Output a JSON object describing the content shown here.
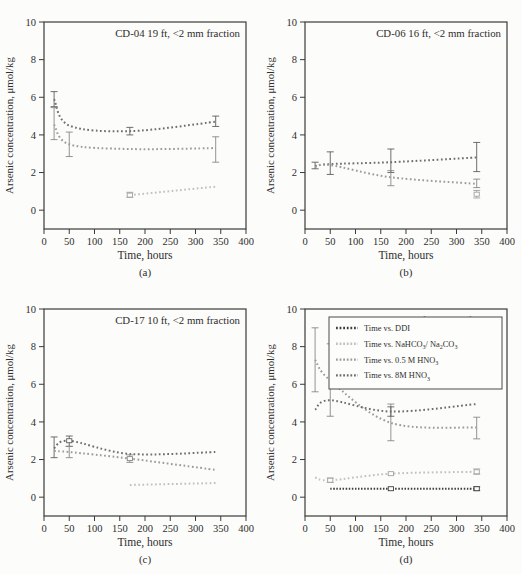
{
  "page": {
    "background": "#fcfcfa",
    "frame_color": "#3a3a3a",
    "text_color": "#2e2e2e"
  },
  "axes": {
    "x": {
      "label": "Time, hours",
      "min": 0,
      "max": 400,
      "ticks": [
        0,
        50,
        100,
        150,
        200,
        250,
        300,
        350,
        400
      ]
    },
    "y": {
      "label": "Arsenic concentration, μmol/kg",
      "min": -1,
      "max": 10,
      "ticks": [
        0,
        2,
        4,
        6,
        8,
        10
      ]
    }
  },
  "series_styles": {
    "ddi": {
      "color": "#3f3f3f",
      "err_color": "#3f3f3f",
      "dash": "1.5 1.6",
      "label_segments": [
        {
          "t": "Time vs. DDI"
        }
      ]
    },
    "nahco3": {
      "color": "#c1c1c1",
      "err_color": "#a2a2a2",
      "dash": "1.7 2.5",
      "label_segments": [
        {
          "t": "Time vs. NaHCO"
        },
        {
          "t": "3",
          "sub": true
        },
        {
          "t": "/ Na",
          "sub": false
        },
        {
          "t": "2",
          "sub": true
        },
        {
          "t": "CO",
          "sub": false
        },
        {
          "t": "3",
          "sub": true
        }
      ]
    },
    "hno3_05": {
      "color": "#9b9b9b",
      "err_color": "#888888",
      "dash": "1.7 2.5",
      "label_segments": [
        {
          "t": "Time vs. 0.5 M HNO"
        },
        {
          "t": "3",
          "sub": true
        }
      ]
    },
    "hno3_8": {
      "color": "#6d6d6d",
      "err_color": "#5e5e5e",
      "dash": "1.7 2.5",
      "label_segments": [
        {
          "t": "Time vs. 8M HNO"
        },
        {
          "t": "3",
          "sub": true
        }
      ]
    }
  },
  "legend": {
    "order": [
      "ddi",
      "nahco3",
      "hno3_05",
      "hno3_8"
    ],
    "position": "upper-right-panel-d"
  },
  "chart_data": [
    {
      "type": "line",
      "panel": "a",
      "title": "CD-04 19 ft, <2 mm fraction",
      "caption": "(a)",
      "xlabel": "Time, hours",
      "ylabel": "Arsenic concentration, μmol/kg",
      "xlim": [
        0,
        400
      ],
      "ylim": [
        -1,
        10
      ],
      "xticks": [
        0,
        50,
        100,
        150,
        200,
        250,
        300,
        350,
        400
      ],
      "yticks": [
        0,
        2,
        4,
        6,
        8,
        10
      ],
      "show_legend": false,
      "series": [
        {
          "key": "hno3_8",
          "name": "Time vs. 8M HNO3",
          "points": [
            {
              "t": 20,
              "v": 5.9,
              "err": [
                5.5,
                6.3
              ]
            },
            {
              "t": 50,
              "v": 4.5
            },
            {
              "t": 170,
              "v": 4.2,
              "err": [
                4.0,
                4.4
              ]
            },
            {
              "t": 340,
              "v": 4.7,
              "err": [
                4.45,
                5.0
              ]
            }
          ]
        },
        {
          "key": "hno3_05",
          "name": "Time vs. 0.5 M HNO3",
          "points": [
            {
              "t": 20,
              "v": 4.55,
              "err": [
                3.75,
                5.45
              ]
            },
            {
              "t": 50,
              "v": 3.5,
              "err": [
                2.85,
                4.15
              ]
            },
            {
              "t": 170,
              "v": 3.25
            },
            {
              "t": 340,
              "v": 3.3,
              "err": [
                2.55,
                3.9
              ]
            }
          ]
        },
        {
          "key": "nahco3",
          "name": "Time vs. NaHCO3/Na2CO3",
          "points": [
            {
              "t": 170,
              "v": 0.8,
              "err": [
                0.68,
                0.95
              ],
              "sq": true
            },
            {
              "t": 340,
              "v": 1.25
            }
          ]
        }
      ]
    },
    {
      "type": "line",
      "panel": "b",
      "title": "CD-06 16 ft, <2 mm fraction",
      "caption": "(b)",
      "xlabel": "Time, hours",
      "ylabel": "Arsenic concentration, μmol/kg",
      "xlim": [
        0,
        400
      ],
      "ylim": [
        -1,
        10
      ],
      "xticks": [
        0,
        50,
        100,
        150,
        200,
        250,
        300,
        350,
        400
      ],
      "yticks": [
        0,
        2,
        4,
        6,
        8,
        10
      ],
      "show_legend": false,
      "series": [
        {
          "key": "hno3_8",
          "name": "Time vs. 8M HNO3",
          "points": [
            {
              "t": 20,
              "v": 2.35,
              "err": [
                2.2,
                2.55
              ]
            },
            {
              "t": 50,
              "v": 2.45,
              "err": [
                1.9,
                3.1
              ]
            },
            {
              "t": 170,
              "v": 2.55,
              "err": [
                2.0,
                3.25
              ]
            },
            {
              "t": 340,
              "v": 2.8,
              "err": [
                2.05,
                3.6
              ]
            }
          ]
        },
        {
          "key": "hno3_05",
          "name": "Time vs. 0.5 M HNO3",
          "points": [
            {
              "t": 20,
              "v": 2.3
            },
            {
              "t": 50,
              "v": 2.4
            },
            {
              "t": 170,
              "v": 1.75,
              "err": [
                1.3,
                2.1
              ]
            },
            {
              "t": 340,
              "v": 1.4,
              "err": [
                1.2,
                1.65
              ]
            }
          ]
        },
        {
          "key": "nahco3",
          "name": "Time vs. NaHCO3/Na2CO3",
          "points": [
            {
              "t": 340,
              "v": 0.85,
              "err": [
                0.65,
                1.05
              ],
              "sq": true
            }
          ]
        }
      ]
    },
    {
      "type": "line",
      "panel": "c",
      "title": "CD-17 10 ft, <2 mm fraction",
      "caption": "(c)",
      "xlabel": "Time, hours",
      "ylabel": "Arsenic concentration, μmol/kg",
      "xlim": [
        0,
        400
      ],
      "ylim": [
        -1,
        10
      ],
      "xticks": [
        0,
        50,
        100,
        150,
        200,
        250,
        300,
        350,
        400
      ],
      "yticks": [
        0,
        2,
        4,
        6,
        8,
        10
      ],
      "show_legend": false,
      "series": [
        {
          "key": "hno3_8",
          "name": "Time vs. 8M HNO3",
          "points": [
            {
              "t": 20,
              "v": 2.6,
              "err": [
                2.1,
                3.2
              ]
            },
            {
              "t": 50,
              "v": 3.0,
              "err": [
                2.7,
                3.25
              ],
              "sq": true
            },
            {
              "t": 170,
              "v": 2.3
            },
            {
              "t": 340,
              "v": 2.4
            }
          ]
        },
        {
          "key": "hno3_05",
          "name": "Time vs. 0.5 M HNO3",
          "points": [
            {
              "t": 20,
              "v": 2.45
            },
            {
              "t": 50,
              "v": 2.4,
              "err": [
                2.1,
                2.7
              ]
            },
            {
              "t": 170,
              "v": 2.05,
              "err": [
                1.85,
                2.25
              ],
              "sq": true
            },
            {
              "t": 340,
              "v": 1.45
            }
          ]
        },
        {
          "key": "nahco3",
          "name": "Time vs. NaHCO3/Na2CO3",
          "points": [
            {
              "t": 170,
              "v": 0.65
            },
            {
              "t": 340,
              "v": 0.75
            }
          ]
        }
      ]
    },
    {
      "type": "line",
      "panel": "d",
      "title": "CD-15 13 ft, <2 mm fraction",
      "caption": "(d)",
      "xlabel": "Time, hours",
      "ylabel": "Arsenic concentration, μmol/kg",
      "xlim": [
        0,
        400
      ],
      "ylim": [
        -1,
        10
      ],
      "xticks": [
        0,
        50,
        100,
        150,
        200,
        250,
        300,
        350,
        400
      ],
      "yticks": [
        0,
        2,
        4,
        6,
        8,
        10
      ],
      "show_legend": true,
      "series": [
        {
          "key": "ddi",
          "name": "Time vs. DDI",
          "points": [
            {
              "t": 50,
              "v": 0.45
            },
            {
              "t": 170,
              "v": 0.45,
              "sq": true
            },
            {
              "t": 340,
              "v": 0.45,
              "err": [
                0.35,
                0.55
              ],
              "sq": true
            }
          ]
        },
        {
          "key": "nahco3",
          "name": "Time vs. NaHCO3/Na2CO3",
          "points": [
            {
              "t": 20,
              "v": 1.05
            },
            {
              "t": 50,
              "v": 0.9,
              "err": [
                0.78,
                1.02
              ],
              "sq": true
            },
            {
              "t": 170,
              "v": 1.25,
              "sq": true
            },
            {
              "t": 340,
              "v": 1.35,
              "err": [
                1.22,
                1.5
              ],
              "sq": true
            }
          ]
        },
        {
          "key": "hno3_05",
          "name": "Time vs. 0.5 M HNO3",
          "points": [
            {
              "t": 20,
              "v": 7.3,
              "err": [
                5.6,
                9.0
              ]
            },
            {
              "t": 50,
              "v": 6.2,
              "err": [
                4.3,
                8.15
              ]
            },
            {
              "t": 170,
              "v": 3.95,
              "err": [
                3.0,
                4.95
              ]
            },
            {
              "t": 340,
              "v": 3.7,
              "err": [
                3.1,
                4.25
              ]
            }
          ]
        },
        {
          "key": "hno3_8",
          "name": "Time vs. 8M HNO3",
          "points": [
            {
              "t": 20,
              "v": 4.65
            },
            {
              "t": 50,
              "v": 5.15
            },
            {
              "t": 170,
              "v": 4.55,
              "err": [
                4.3,
                4.8
              ]
            },
            {
              "t": 340,
              "v": 4.95
            }
          ]
        }
      ]
    }
  ]
}
